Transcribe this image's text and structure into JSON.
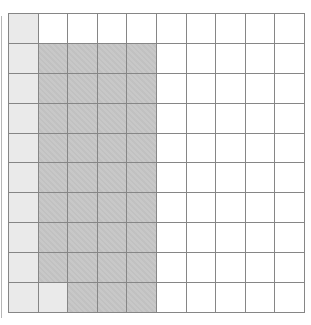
{
  "grid": {
    "rows": 10,
    "cols": 10,
    "line_color": "#868686",
    "cell_colors": {
      "W": "#ffffff",
      "L": "#eaeaea",
      "D": "#c5c5c5"
    },
    "cells": [
      "LWWWWWWWWW",
      "LDDDDWWWWW",
      "LDDDDWWWWW",
      "LDDDDWWWWW",
      "LDDDDWWWWW",
      "LDDDDWWWWW",
      "LDDDDWWWWW",
      "LDDDDWWWWW",
      "LDDDDWWWWW",
      "LLDDDWWWWW"
    ]
  },
  "artifact": {
    "left_edge_line_color": "#8f8f8f"
  }
}
